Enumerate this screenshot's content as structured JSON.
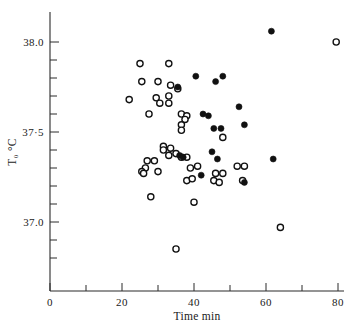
{
  "chart_data": {
    "type": "scatter",
    "title": "",
    "xlabel": "Time min",
    "ylabel": "T₀ °C",
    "xlim": [
      0,
      84
    ],
    "ylim": [
      36.72,
      38.12
    ],
    "grid": false,
    "legend": "none",
    "xticks_major": [
      0,
      20,
      40,
      60,
      80
    ],
    "xticklabels": [
      "0",
      "20",
      "40",
      "60",
      "80"
    ],
    "xticks_minor": [
      10,
      30,
      50,
      70
    ],
    "yticks_major": [
      37.0,
      37.5,
      38.0
    ],
    "yticklabels": [
      "37.0",
      "37·5",
      "38.0"
    ],
    "yticks_minor": [
      36.8,
      36.9,
      37.1,
      37.2,
      37.3,
      37.4,
      37.6,
      37.7,
      37.8,
      37.9
    ],
    "series": [
      {
        "name": "open",
        "marker": "open-circle",
        "color": "#111111",
        "points": [
          [
            25.0,
            37.88
          ],
          [
            33.0,
            37.88
          ],
          [
            79.5,
            38.0
          ],
          [
            25.5,
            37.78
          ],
          [
            30.0,
            37.78
          ],
          [
            33.5,
            37.76
          ],
          [
            35.5,
            37.74
          ],
          [
            22.0,
            37.68
          ],
          [
            29.5,
            37.69
          ],
          [
            30.5,
            37.66
          ],
          [
            33.0,
            37.7
          ],
          [
            33.0,
            37.66
          ],
          [
            27.5,
            37.6
          ],
          [
            36.5,
            37.6
          ],
          [
            38.0,
            37.59
          ],
          [
            37.5,
            37.57
          ],
          [
            36.5,
            37.54
          ],
          [
            36.5,
            37.51
          ],
          [
            48.0,
            37.47
          ],
          [
            31.5,
            37.42
          ],
          [
            31.5,
            37.4
          ],
          [
            33.5,
            37.41
          ],
          [
            33.0,
            37.37
          ],
          [
            35.0,
            37.38
          ],
          [
            36.5,
            37.36
          ],
          [
            38.0,
            37.36
          ],
          [
            27.0,
            37.34
          ],
          [
            29.0,
            37.34
          ],
          [
            26.5,
            37.3
          ],
          [
            25.5,
            37.28
          ],
          [
            26.0,
            37.27
          ],
          [
            30.0,
            37.28
          ],
          [
            39.0,
            37.3
          ],
          [
            41.0,
            37.31
          ],
          [
            46.0,
            37.27
          ],
          [
            48.0,
            37.27
          ],
          [
            52.0,
            37.31
          ],
          [
            54.0,
            37.31
          ],
          [
            38.0,
            37.23
          ],
          [
            39.5,
            37.24
          ],
          [
            45.5,
            37.23
          ],
          [
            47.0,
            37.22
          ],
          [
            53.5,
            37.23
          ],
          [
            28.0,
            37.14
          ],
          [
            40.0,
            37.11
          ],
          [
            64.0,
            36.97
          ],
          [
            35.0,
            36.85
          ]
        ]
      },
      {
        "name": "filled",
        "marker": "filled-circle",
        "color": "#111111",
        "points": [
          [
            61.5,
            38.06
          ],
          [
            40.5,
            37.81
          ],
          [
            48.0,
            37.81
          ],
          [
            46.0,
            37.78
          ],
          [
            35.5,
            37.75
          ],
          [
            52.5,
            37.64
          ],
          [
            42.5,
            37.6
          ],
          [
            44.0,
            37.59
          ],
          [
            54.0,
            37.54
          ],
          [
            45.5,
            37.52
          ],
          [
            47.5,
            37.52
          ],
          [
            36.0,
            37.37
          ],
          [
            37.0,
            37.36
          ],
          [
            45.0,
            37.39
          ],
          [
            46.5,
            37.35
          ],
          [
            62.0,
            37.35
          ],
          [
            42.0,
            37.26
          ],
          [
            54.0,
            37.22
          ]
        ]
      }
    ]
  }
}
